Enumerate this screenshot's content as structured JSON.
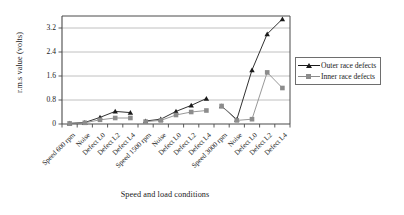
{
  "chart_data": {
    "type": "line",
    "title": "",
    "xlabel": "Speed and load conditions",
    "ylabel": "r.m.s value (volts)",
    "ylim": [
      0,
      3.6
    ],
    "yticks": [
      0,
      0.8,
      1.6,
      2.4,
      3.2
    ],
    "ytick_labels": [
      "0",
      "0.8",
      "1.6",
      "2.4",
      "3.2"
    ],
    "grid": "horizontal",
    "legend_position": "right",
    "categories": [
      "Speed 600 rpm",
      "Noise",
      "Defect L0",
      "Defect L2",
      "Defect L4",
      "Speed 1500 rpm",
      "Noise",
      "Defect L0",
      "Defect L2",
      "Defect L4",
      "Speed 3000 rpm",
      "Noise",
      "Defect L0",
      "Defect L2",
      "Defect L4"
    ],
    "series": [
      {
        "name": "Outer race defects",
        "color": "#1a1a1a",
        "marker": "triangle",
        "values": [
          0.02,
          0.05,
          0.22,
          0.42,
          0.38,
          0.1,
          0.16,
          0.42,
          0.62,
          0.85,
          0.6,
          0.15,
          1.8,
          3.0,
          3.5
        ]
      },
      {
        "name": "Inner race defects",
        "color": "#8c8c8c",
        "marker": "square",
        "values": [
          0.02,
          0.04,
          0.14,
          0.2,
          0.2,
          0.08,
          0.12,
          0.3,
          0.4,
          0.45,
          0.6,
          0.12,
          0.16,
          1.72,
          1.2
        ]
      }
    ],
    "group_breaks": [
      5,
      10
    ],
    "annotations": []
  },
  "legend": {
    "items": [
      {
        "label": "Outer race defects",
        "color": "#1a1a1a",
        "marker": "triangle"
      },
      {
        "label": "Inner race defects",
        "color": "#8c8c8c",
        "marker": "square"
      }
    ]
  }
}
